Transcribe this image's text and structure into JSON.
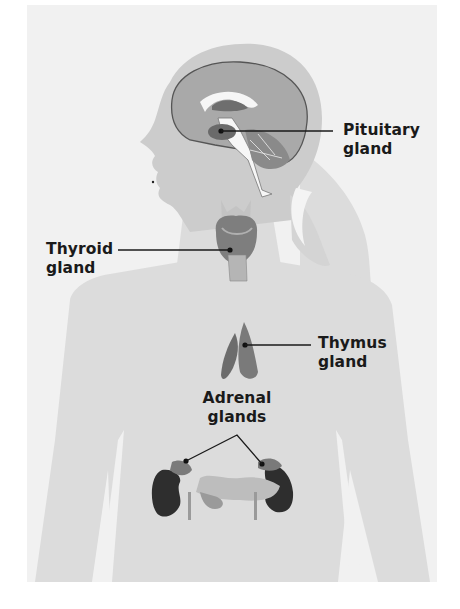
{
  "diagram": {
    "colors": {
      "panel_bg": "#f1f1f1",
      "silhouette": "#dcdcdc",
      "head_shade": "#c9c9c9",
      "brain": "#a9a9a9",
      "brain_outline": "#555555",
      "organ_dark": "#2e2e2e",
      "leader_line": "#1a1a1a",
      "label_text": "#1a1a1a"
    },
    "labels": [
      {
        "id": "pituitary",
        "line1": "Pituitary",
        "line2": "gland"
      },
      {
        "id": "thyroid",
        "line1": "Thyroid",
        "line2": "gland"
      },
      {
        "id": "thymus",
        "line1": "Thymus",
        "line2": "gland"
      },
      {
        "id": "adrenal",
        "line1": "Adrenal",
        "line2": "glands"
      }
    ]
  }
}
